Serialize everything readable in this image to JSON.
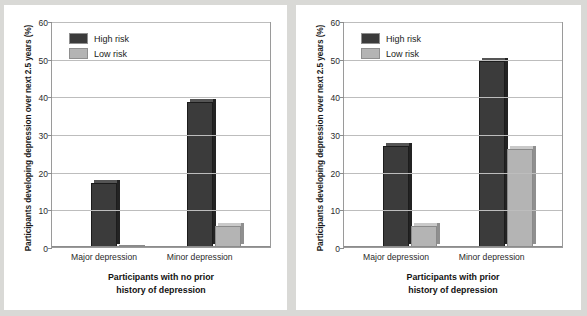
{
  "figure": {
    "background_color": "#d9d9d6",
    "panel_color": "#ffffff",
    "series_colors": {
      "high_risk": "#3b3b3b",
      "low_risk": "#b4b4b4"
    }
  },
  "ylabel": "Participants developing depression over next 2.5 years (%)",
  "yticks": [
    "0",
    "10",
    "20",
    "30",
    "40",
    "50",
    "60"
  ],
  "legend": {
    "high_risk": "High risk",
    "low_risk": "Low risk"
  },
  "categories": [
    "Major depression",
    "Minor depression"
  ],
  "left_caption": {
    "line1": "Participants with no prior",
    "line2": "history of depression"
  },
  "right_caption": {
    "line1": "Participants with prior",
    "line2": "history of depression"
  },
  "chart_data": [
    {
      "type": "bar",
      "title": "",
      "panel": "Participants with no prior history of depression",
      "categories": [
        "Major depression",
        "Minor depression"
      ],
      "series": [
        {
          "name": "High risk",
          "values": [
            17,
            38.5
          ],
          "color": "#3b3b3b"
        },
        {
          "name": "Low risk",
          "values": [
            0.5,
            5.5
          ],
          "color": "#b4b4b4"
        }
      ],
      "xlabel": "Participants with no prior history of depression",
      "ylabel": "Participants developing depression over next 2.5 years (%)",
      "ylim": [
        0,
        60
      ],
      "yticks": [
        0,
        10,
        20,
        30,
        40,
        50,
        60
      ],
      "grid": true,
      "legend_position": "top-left"
    },
    {
      "type": "bar",
      "title": "",
      "panel": "Participants with prior history of depression",
      "categories": [
        "Major depression",
        "Minor depression"
      ],
      "series": [
        {
          "name": "High risk",
          "values": [
            26.8,
            49.5
          ],
          "color": "#3b3b3b"
        },
        {
          "name": "Low risk",
          "values": [
            5.5,
            26.0
          ],
          "color": "#b4b4b4"
        }
      ],
      "xlabel": "Participants with prior history of depression",
      "ylabel": "Participants developing depression over next 2.5 years (%)",
      "ylim": [
        0,
        60
      ],
      "yticks": [
        0,
        10,
        20,
        30,
        40,
        50,
        60
      ],
      "grid": true,
      "legend_position": "top-left"
    }
  ]
}
